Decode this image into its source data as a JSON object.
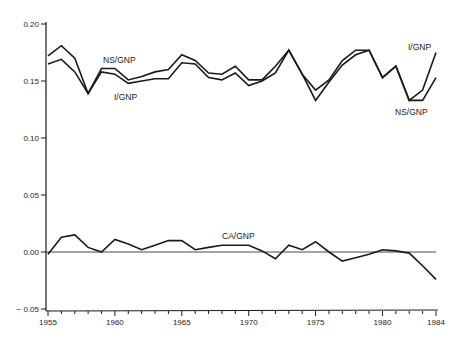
{
  "chart_data": {
    "type": "line",
    "title": "",
    "xlabel": "",
    "ylabel": "",
    "x": [
      1955,
      1956,
      1957,
      1958,
      1959,
      1960,
      1961,
      1962,
      1963,
      1964,
      1965,
      1966,
      1967,
      1968,
      1969,
      1970,
      1971,
      1972,
      1973,
      1974,
      1975,
      1976,
      1977,
      1978,
      1979,
      1980,
      1981,
      1982,
      1983,
      1984
    ],
    "xlim": [
      1955,
      1984
    ],
    "ylim": [
      -0.05,
      0.2
    ],
    "x_ticks": [
      "1955",
      "1960",
      "1965",
      "1970",
      "1975",
      "1980",
      "1984"
    ],
    "x_tick_values": [
      1955,
      1960,
      1965,
      1970,
      1975,
      1980,
      1984
    ],
    "y_ticks": [
      "0.20",
      "0.15",
      "0.10",
      "0.05",
      "0.00",
      "− 0.05"
    ],
    "y_tick_values": [
      0.2,
      0.15,
      0.1,
      0.05,
      0.0,
      -0.05
    ],
    "grid": false,
    "zero_reference_line": true,
    "legend_position": "inline labels",
    "series": [
      {
        "name": "NS/GNP",
        "values": [
          0.172,
          0.181,
          0.17,
          0.139,
          0.161,
          0.161,
          0.151,
          0.154,
          0.158,
          0.16,
          0.173,
          0.168,
          0.157,
          0.156,
          0.163,
          0.151,
          0.151,
          0.163,
          0.177,
          0.156,
          0.133,
          0.149,
          0.164,
          0.173,
          0.177,
          0.153,
          0.163,
          0.133,
          0.133,
          0.153
        ],
        "labels": [
          {
            "text": "NS/GNP",
            "x": 103,
            "y": 63
          },
          {
            "text": "NS/GNP",
            "x": 395,
            "y": 115
          }
        ]
      },
      {
        "name": "I/GNP",
        "values": [
          0.165,
          0.169,
          0.158,
          0.139,
          0.158,
          0.156,
          0.148,
          0.15,
          0.152,
          0.152,
          0.166,
          0.165,
          0.153,
          0.151,
          0.157,
          0.146,
          0.15,
          0.157,
          0.177,
          0.156,
          0.142,
          0.151,
          0.168,
          0.177,
          0.177,
          0.153,
          0.163,
          0.133,
          0.142,
          0.175
        ],
        "labels": [
          {
            "text": "I/GNP",
            "x": 114,
            "y": 100
          },
          {
            "text": "I/GNP",
            "x": 408,
            "y": 50
          }
        ]
      },
      {
        "name": "CA/GNP",
        "values": [
          -0.002,
          0.013,
          0.015,
          0.004,
          0.0,
          0.011,
          0.007,
          0.002,
          0.006,
          0.01,
          0.01,
          0.002,
          0.004,
          0.006,
          0.006,
          0.006,
          0.001,
          -0.006,
          0.006,
          0.002,
          0.009,
          0.0,
          -0.008,
          -0.005,
          -0.002,
          0.002,
          0.001,
          -0.001,
          -0.012,
          -0.024
        ],
        "labels": [
          {
            "text": "CA/GNP",
            "x": 222,
            "y": 239
          }
        ]
      }
    ]
  },
  "layout": {
    "plot_left": 48,
    "plot_right": 436,
    "y_top_px": 24,
    "y_zero_px": 252,
    "px_per_unit": 1140
  }
}
